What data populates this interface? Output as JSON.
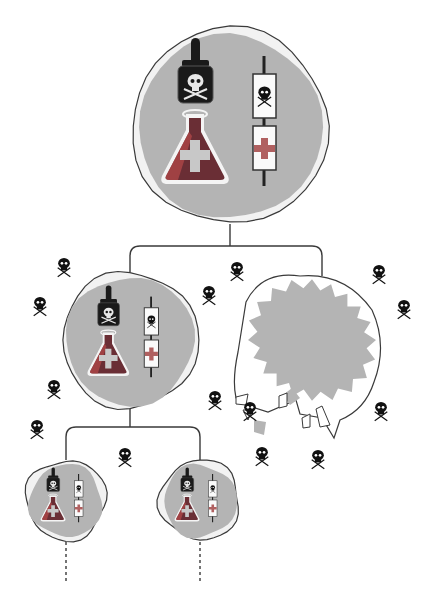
{
  "colors": {
    "background": "#ffffff",
    "cell_fill": "#b4b4b4",
    "cell_halo": "#f2f2f2",
    "outline": "#3a3a3a",
    "bottle": "#1a1a1a",
    "liquid": "#6a2e35",
    "liquid_edge": "#b84a4a",
    "cross": "#c8c8c8",
    "cross_red": "#b06060",
    "skull": "#111111",
    "dead_blob": "#b4b4b4"
  },
  "nodes": [
    {
      "id": "root",
      "label": "parent-cell",
      "cx": 230,
      "cy": 126,
      "r": 98,
      "scale": 1.0
    },
    {
      "id": "child-alive",
      "label": "surviving-daughter-cell",
      "cx": 130,
      "cy": 340,
      "r": 68,
      "scale": 0.62
    },
    {
      "id": "grandchild-left",
      "label": "granddaughter-cell-left",
      "cx": 66,
      "cy": 500,
      "r": 40,
      "scale": 0.37
    },
    {
      "id": "grandchild-right",
      "label": "granddaughter-cell-right",
      "cx": 200,
      "cy": 500,
      "r": 40,
      "scale": 0.37
    }
  ],
  "dead_cell": {
    "id": "child-dead",
    "label": "lysed-daughter-cell",
    "cx": 318,
    "cy": 340
  },
  "skulls": [
    {
      "x": 64,
      "y": 266
    },
    {
      "x": 40,
      "y": 305
    },
    {
      "x": 209,
      "y": 294
    },
    {
      "x": 237,
      "y": 270
    },
    {
      "x": 379,
      "y": 273
    },
    {
      "x": 404,
      "y": 308
    },
    {
      "x": 54,
      "y": 388
    },
    {
      "x": 37,
      "y": 428
    },
    {
      "x": 125,
      "y": 456
    },
    {
      "x": 215,
      "y": 399
    },
    {
      "x": 250,
      "y": 410
    },
    {
      "x": 381,
      "y": 410
    },
    {
      "x": 262,
      "y": 455
    },
    {
      "x": 318,
      "y": 458
    }
  ]
}
